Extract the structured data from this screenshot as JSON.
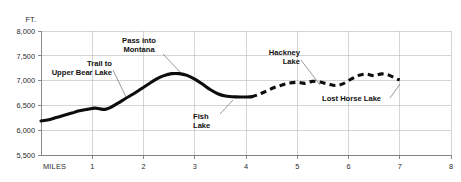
{
  "chart_data": {
    "type": "line",
    "title": "",
    "subtitle": "",
    "xlabel": "MILES",
    "ylabel": "FT.",
    "xlim": [
      0,
      8
    ],
    "ylim": [
      5500,
      8000
    ],
    "grid": true,
    "legend": "none",
    "x_ticks": [
      "1",
      "2",
      "3",
      "4",
      "5",
      "6",
      "7",
      "8"
    ],
    "x_tick_values": [
      1,
      2,
      3,
      4,
      5,
      6,
      7,
      8
    ],
    "y_ticks": [
      "5,500",
      "6,000",
      "6,500",
      "7,000",
      "7,500",
      "8,000"
    ],
    "y_tick_values": [
      5500,
      6000,
      6500,
      7000,
      7500,
      8000
    ],
    "series": [
      {
        "name": "trail-elevation-surveyed",
        "style": "solid",
        "x": [
          0.0,
          0.15,
          0.3,
          0.45,
          0.6,
          0.75,
          0.9,
          1.05,
          1.15,
          1.25,
          1.35,
          1.5,
          1.65,
          1.8,
          1.95,
          2.1,
          2.25,
          2.4,
          2.55,
          2.7,
          2.85,
          3.0,
          3.15,
          3.3,
          3.45,
          3.6,
          3.8,
          4.0,
          4.1
        ],
        "y": [
          6185,
          6210,
          6255,
          6300,
          6345,
          6390,
          6420,
          6445,
          6430,
          6420,
          6455,
          6545,
          6640,
          6730,
          6830,
          6930,
          7030,
          7100,
          7140,
          7140,
          7105,
          7030,
          6930,
          6820,
          6735,
          6690,
          6672,
          6668,
          6672
        ]
      },
      {
        "name": "trail-elevation-estimated",
        "style": "dashed",
        "x": [
          4.1,
          4.25,
          4.4,
          4.55,
          4.7,
          4.85,
          5.0,
          5.15,
          5.3,
          5.45,
          5.6,
          5.75,
          5.9,
          6.05,
          6.2,
          6.35,
          6.5,
          6.65,
          6.8,
          6.95,
          7.0
        ],
        "y": [
          6672,
          6720,
          6790,
          6860,
          6910,
          6950,
          6965,
          6945,
          6985,
          6970,
          6930,
          6900,
          6940,
          7030,
          7105,
          7130,
          7100,
          7135,
          7105,
          7030,
          7015
        ]
      }
    ],
    "annotations": [
      {
        "id": "trail-to-upper-bear-lake",
        "lines": [
          "Trail to",
          "Upper Bear Lake"
        ],
        "align": "end",
        "text_x": 112,
        "text_y": 66,
        "line_height": 8.6,
        "leader": [
          [
            113,
            70
          ],
          [
            126,
            97
          ]
        ]
      },
      {
        "id": "pass-into-montana",
        "lines": [
          "Pass into",
          "Montana"
        ],
        "align": "middle",
        "text_x": 139,
        "text_y": 43,
        "line_height": 8.6,
        "leader": [
          [
            163,
            54
          ],
          [
            180,
            72
          ]
        ]
      },
      {
        "id": "fish-lake",
        "lines": [
          "Fish",
          "Lake"
        ],
        "align": "start",
        "text_x": 193,
        "text_y": 119,
        "line_height": 8.6,
        "leader": [
          [
            220,
            114
          ],
          [
            233,
            100
          ]
        ]
      },
      {
        "id": "hackney-lake",
        "lines": [
          "Hackney",
          "Lake"
        ],
        "align": "end",
        "text_x": 300,
        "text_y": 55,
        "line_height": 8.6,
        "leader": [
          [
            301,
            60
          ],
          [
            320,
            85
          ]
        ]
      },
      {
        "id": "lost-horse-lake",
        "lines": [
          "Lost Horse Lake"
        ],
        "align": "start",
        "text_x": 322,
        "text_y": 101,
        "line_height": 8.6,
        "leader": [
          [
            390,
            98
          ],
          [
            400,
            84
          ]
        ]
      }
    ],
    "colors": {
      "profile_line": "#0d0d0d",
      "gridline": "#b9b9b9",
      "axis": "#6e6e6e",
      "text": "#2a2a2a",
      "annotation_text": "#111111",
      "background": "#ffffff"
    }
  }
}
